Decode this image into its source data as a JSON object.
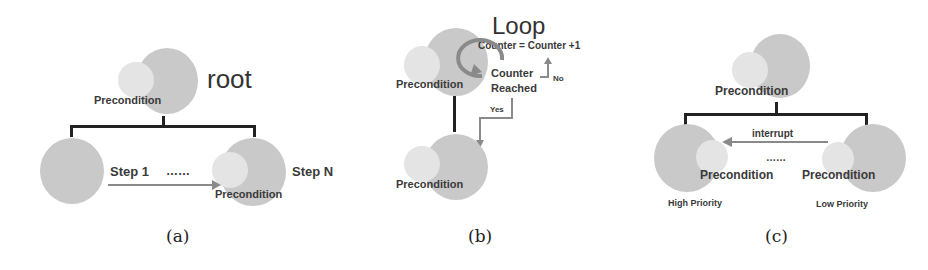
{
  "panels": {
    "a": {
      "caption": "(a)",
      "root_label": "root",
      "precondition_label": "Precondition",
      "step1_label": "Step 1",
      "dots": "……",
      "stepN_label": "Step N",
      "precondition_label_2": "Precondition"
    },
    "b": {
      "caption": "(b)",
      "loop_label": "Loop",
      "counter_expr": "Counter = Counter +1",
      "counter_reached_1": "Counter",
      "counter_reached_2": "Reached",
      "no_label": "No",
      "yes_label": "Yes",
      "precondition_top": "Precondition",
      "precondition_bottom": "Precondition"
    },
    "c": {
      "caption": "(c)",
      "precondition_top": "Precondition",
      "interrupt_label": "interrupt",
      "dots": "……",
      "precondition_left": "Precondition",
      "precondition_right": "Precondition",
      "high_priority": "High Priority",
      "low_priority": "Low Priority"
    }
  },
  "colors": {
    "node": "#c9c9c9",
    "precondition": "#e4e4e4",
    "arrow": "#8a8a8a",
    "line": "#222222"
  }
}
